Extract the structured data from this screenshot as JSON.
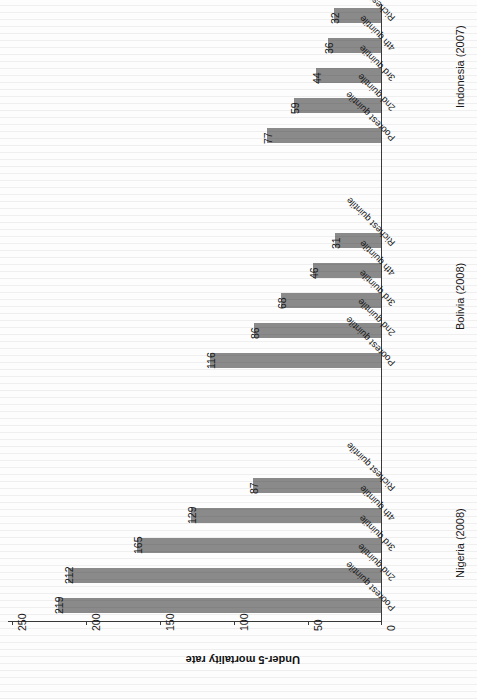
{
  "chart_data": {
    "type": "bar",
    "title": "",
    "xlabel": "",
    "ylabel": "Under-5 mortality rate",
    "ylim": [
      0,
      250
    ],
    "yticks": [
      "0",
      "50",
      "100",
      "150",
      "200",
      "250"
    ],
    "grid": false,
    "legend": "none",
    "orientation": "rotated-180",
    "categories": [
      "Poorest quintile",
      "2nd quintile",
      "3rd quintile",
      "4th quintile",
      "Richest quintile"
    ],
    "groups": [
      {
        "name": "Nigeria (2008)",
        "values": [
          219,
          212,
          165,
          129,
          87
        ],
        "labels": [
          "219",
          "212",
          "165",
          "129",
          "87"
        ]
      },
      {
        "name": "Bolivia (2008)",
        "values": [
          116,
          86,
          68,
          46,
          31
        ],
        "labels": [
          "116",
          "86",
          "68",
          "46",
          "31"
        ]
      },
      {
        "name": "Indonesia (2007)",
        "values": [
          77,
          59,
          44,
          36,
          32
        ],
        "labels": [
          "77",
          "59",
          "44",
          "36",
          "32"
        ]
      }
    ],
    "colors": {
      "bar": "#8a8a8a",
      "axis": "#3a3a3a",
      "text": "#1a1a1a",
      "background": "#fdfdfd"
    }
  },
  "axis": {
    "title": "Under-5 mortality rate",
    "ticks": [
      {
        "label": "250",
        "x": 12
      },
      {
        "label": "200",
        "x": 86
      },
      {
        "label": "150",
        "x": 160
      },
      {
        "label": "100",
        "x": 234
      },
      {
        "label": "50",
        "x": 308
      },
      {
        "label": "0",
        "x": 381
      }
    ]
  },
  "bars": [
    {
      "group": "Indonesia (2007)",
      "category": "Poorest quintile",
      "value": 77,
      "label": "77",
      "top": 128
    },
    {
      "group": "Indonesia (2007)",
      "category": "2nd quintile",
      "value": 59,
      "label": "59",
      "top": 98
    },
    {
      "group": "Indonesia (2007)",
      "category": "3rd quintile",
      "value": 44,
      "label": "44",
      "top": 68
    },
    {
      "group": "Indonesia (2007)",
      "category": "4th quintile",
      "value": 36,
      "label": "36",
      "top": 38
    },
    {
      "group": "Indonesia (2007)",
      "category": "Richest quintile",
      "value": 32,
      "label": "32",
      "top": 8
    },
    {
      "group": "Bolivia (2008)",
      "category": "Poorest quintile",
      "value": 116,
      "label": "116",
      "top": 353
    },
    {
      "group": "Bolivia (2008)",
      "category": "2nd quintile",
      "value": 86,
      "label": "86",
      "top": 323
    },
    {
      "group": "Bolivia (2008)",
      "category": "3rd quintile",
      "value": 68,
      "label": "68",
      "top": 293
    },
    {
      "group": "Bolivia (2008)",
      "category": "4th quintile",
      "value": 46,
      "label": "46",
      "top": 263
    },
    {
      "group": "Bolivia (2008)",
      "category": "Richest quintile",
      "value": 31,
      "label": "31",
      "top": 233
    },
    {
      "group": "Nigeria (2008)",
      "category": "Poorest quintile",
      "value": 219,
      "label": "219",
      "top": 598
    },
    {
      "group": "Nigeria (2008)",
      "category": "2nd quintile",
      "value": 212,
      "label": "212",
      "top": 568
    },
    {
      "group": "Nigeria (2008)",
      "category": "3rd quintile",
      "value": 165,
      "label": "165",
      "top": 538
    },
    {
      "group": "Nigeria (2008)",
      "category": "4th quintile",
      "value": 129,
      "label": "129",
      "top": 508
    },
    {
      "group": "Nigeria (2008)",
      "category": "Richest quintile",
      "value": 87,
      "label": "87",
      "top": 478
    }
  ],
  "category_labels": [
    {
      "text": "Poorest quintile",
      "top": 143
    },
    {
      "text": "2nd quintile",
      "top": 113
    },
    {
      "text": "3rd quintile",
      "top": 83
    },
    {
      "text": "4th quintile",
      "top": 53
    },
    {
      "text": "Richest quintile",
      "top": 23
    },
    {
      "text": "Poorest quintile",
      "top": 368
    },
    {
      "text": "2nd quintile",
      "top": 338
    },
    {
      "text": "3rd quintile",
      "top": 308
    },
    {
      "text": "4th quintile",
      "top": 278
    },
    {
      "text": "Richest quintile",
      "top": 248
    },
    {
      "text": "Poorest quintile",
      "top": 613
    },
    {
      "text": "2nd quintile",
      "top": 583
    },
    {
      "text": "3rd quintile",
      "top": 553
    },
    {
      "text": "4th quintile",
      "top": 523
    },
    {
      "text": "Richest quintile",
      "top": 493
    }
  ],
  "group_labels": [
    {
      "text": "Indonesia (2007)",
      "top": 108
    },
    {
      "text": "Bolivia (2008)",
      "top": 330
    },
    {
      "text": "Nigeria (2008)",
      "top": 578
    }
  ]
}
